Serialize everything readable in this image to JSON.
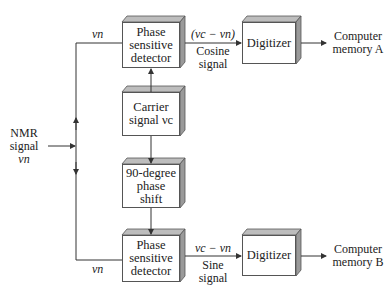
{
  "diagram": {
    "input": {
      "line1": "NMR",
      "line2": "signal",
      "symbol": "ν_n",
      "symbol_display": "νn"
    },
    "blocks": {
      "psd_top": {
        "line1": "Phase",
        "line2": "sensitive",
        "line3": "detector"
      },
      "carrier": {
        "line1": "Carrier",
        "line2": "signal νc"
      },
      "phase_shift": {
        "line1": "90-degree",
        "line2": "phase",
        "line3": "shift"
      },
      "psd_bottom": {
        "line1": "Phase",
        "line2": "sensitive",
        "line3": "detector"
      },
      "digitizer_a": {
        "label": "Digitizer"
      },
      "digitizer_b": {
        "label": "Digitizer"
      }
    },
    "edges": {
      "top_branch_label": "νn",
      "bottom_branch_label": "νn",
      "cosine_expr": "(νc − νn)",
      "cosine_line1": "Cosine",
      "cosine_line2": "signal",
      "sine_expr": "νc − νn",
      "sine_line1": "Sine",
      "sine_line2": "signal"
    },
    "outputs": {
      "a_line1": "Computer",
      "a_line2": "memory A",
      "b_line1": "Computer",
      "b_line2": "memory B"
    },
    "colors": {
      "line": "#333333",
      "box_border": "#555555",
      "box_side": "#9a9a9a",
      "box_top": "#bdbdbd"
    }
  }
}
